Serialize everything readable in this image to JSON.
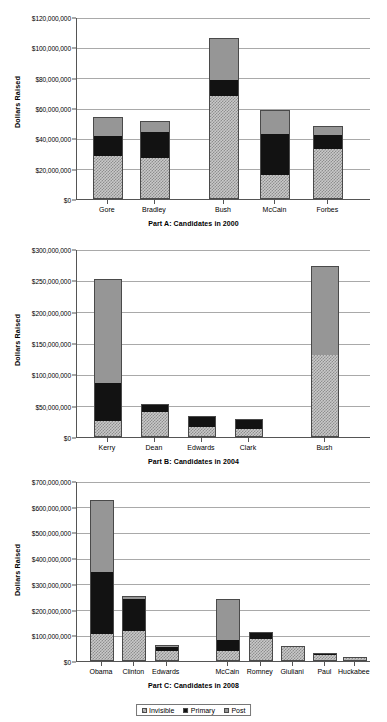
{
  "chart_data": [
    {
      "type": "bar",
      "stacked": true,
      "title": "Part A: Candidates in 2000",
      "xlabel": "",
      "ylabel": "Dollars Raised",
      "ylim": [
        0,
        120000000
      ],
      "ytick_step": 20000000,
      "ytick_labels": [
        "$0",
        "$20,000,000",
        "$40,000,000",
        "$60,000,000",
        "$80,000,000",
        "$100,000,000",
        "$120,000,000"
      ],
      "grid": true,
      "legend": [
        "Invisible",
        "Primary",
        "Post"
      ],
      "categories": [
        "Gore",
        "Bradley",
        "Bush",
        "McCain",
        "Forbes"
      ],
      "series": [
        {
          "name": "Invisible",
          "values": [
            28500000,
            27000000,
            68000000,
            15500000,
            33000000
          ]
        },
        {
          "name": "Primary",
          "values": [
            13500000,
            17500000,
            11000000,
            28000000,
            10000000
          ]
        },
        {
          "name": "Post",
          "values": [
            12000000,
            7000000,
            27000000,
            15000000,
            5000000
          ]
        }
      ],
      "totals": [
        54000000,
        51500000,
        106000000,
        58500000,
        48000000
      ]
    },
    {
      "type": "bar",
      "stacked": true,
      "title": "Part B: Candidates in 2004",
      "xlabel": "",
      "ylabel": "Dollars Raised",
      "ylim": [
        0,
        300000000
      ],
      "ytick_step": 50000000,
      "ytick_labels": [
        "$0",
        "$50,000,000",
        "$100,000,000",
        "$150,000,000",
        "$200,000,000",
        "$250,000,000",
        "$300,000,000"
      ],
      "grid": true,
      "legend": [
        "Invisible",
        "Primary",
        "Post"
      ],
      "categories": [
        "Kerry",
        "Dean",
        "Edwards",
        "Clark",
        "Bush"
      ],
      "series": [
        {
          "name": "Invisible",
          "values": [
            25000000,
            41000000,
            16000000,
            12000000,
            131000000
          ]
        },
        {
          "name": "Primary",
          "values": [
            61000000,
            11000000,
            17000000,
            16000000,
            0
          ]
        },
        {
          "name": "Post",
          "values": [
            166000000,
            0,
            0,
            0,
            142000000
          ]
        }
      ],
      "totals": [
        252000000,
        52000000,
        33000000,
        28000000,
        273000000
      ]
    },
    {
      "type": "bar",
      "stacked": true,
      "title": "Part C: Candidates in 2008",
      "xlabel": "",
      "ylabel": "Dollars Raised",
      "ylim": [
        0,
        700000000
      ],
      "ytick_step": 100000000,
      "ytick_labels": [
        "$0",
        "$100,000,000",
        "$200,000,000",
        "$300,000,000",
        "$400,000,000",
        "$500,000,000",
        "$600,000,000",
        "$700,000,000"
      ],
      "grid": true,
      "legend": [
        "Invisible",
        "Primary",
        "Post"
      ],
      "categories": [
        "Obama",
        "Clinton",
        "Edwards",
        "McCain",
        "Romney",
        "Giuliani",
        "Paul",
        "Huckabee"
      ],
      "series": [
        {
          "name": "Invisible",
          "values": [
            103000000,
            117000000,
            42000000,
            38000000,
            90000000,
            60000000,
            27000000,
            12000000
          ]
        },
        {
          "name": "Primary",
          "values": [
            245000000,
            128000000,
            14000000,
            41000000,
            21000000,
            0,
            6000000,
            4000000
          ]
        },
        {
          "name": "Post",
          "values": [
            277000000,
            7000000,
            6000000,
            161000000,
            0,
            0,
            0,
            0
          ]
        }
      ],
      "totals": [
        625000000,
        252000000,
        62000000,
        240000000,
        111000000,
        60000000,
        33000000,
        16000000
      ]
    }
  ],
  "legend": {
    "items": [
      {
        "label": "Invisible",
        "key": "invisible",
        "color": "#c9c9c9"
      },
      {
        "label": "Primary",
        "key": "primary",
        "color": "#121212"
      },
      {
        "label": "Post",
        "key": "post",
        "color": "#969696"
      }
    ]
  }
}
